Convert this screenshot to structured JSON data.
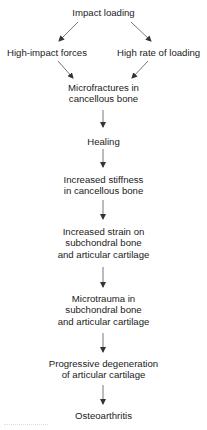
{
  "diagram": {
    "type": "flowchart",
    "direction": "top-to-bottom",
    "nodes": {
      "impact_loading": {
        "lines": [
          "Impact loading"
        ]
      },
      "high_impact_forces": {
        "lines": [
          "High-impact forces"
        ]
      },
      "high_rate_of_loading": {
        "lines": [
          "High rate of loading"
        ]
      },
      "microfractures": {
        "lines": [
          "Microfractures in",
          "cancellous bone"
        ]
      },
      "healing": {
        "lines": [
          "Healing"
        ]
      },
      "increased_stiffness": {
        "lines": [
          "Increased stiffness",
          "in cancellous bone"
        ]
      },
      "increased_strain": {
        "lines": [
          "Increased strain on",
          "subchondral bone",
          "and articular cartilage"
        ]
      },
      "microtrauma": {
        "lines": [
          "Microtrauma in",
          "subchondral bone",
          "and articular cartilage"
        ]
      },
      "progressive_degeneration": {
        "lines": [
          "Progressive degeneration",
          "of articular cartilage"
        ]
      },
      "osteoarthritis": {
        "lines": [
          "Osteoarthritis"
        ]
      }
    },
    "edges": [
      [
        "impact_loading",
        "high_impact_forces"
      ],
      [
        "impact_loading",
        "high_rate_of_loading"
      ],
      [
        "high_impact_forces",
        "microfractures"
      ],
      [
        "high_rate_of_loading",
        "microfractures"
      ],
      [
        "microfractures",
        "healing"
      ],
      [
        "healing",
        "increased_stiffness"
      ],
      [
        "increased_stiffness",
        "increased_strain"
      ],
      [
        "increased_strain",
        "microtrauma"
      ],
      [
        "microtrauma",
        "progressive_degeneration"
      ],
      [
        "progressive_degeneration",
        "osteoarthritis"
      ]
    ],
    "colors": {
      "text": "#222222",
      "arrow": "#333333",
      "background": "#ffffff"
    }
  }
}
